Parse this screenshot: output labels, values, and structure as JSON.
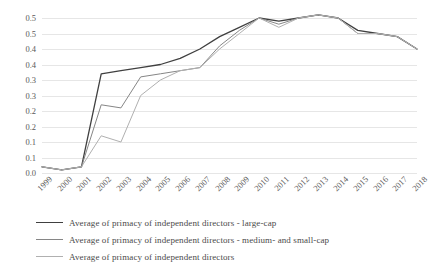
{
  "chart_data": {
    "type": "line",
    "title": "",
    "xlabel": "",
    "ylabel": "",
    "grid": true,
    "legend_position": "bottom",
    "ylim": [
      0,
      0.5
    ],
    "ytick_values": [
      0.5,
      0.45,
      0.4,
      0.35,
      0.3,
      0.25,
      0.2,
      0.15,
      0.1,
      0.05,
      0.0
    ],
    "ytick_labels": [
      "0.5",
      "0.5",
      "0.4",
      "0.4",
      "0.3",
      "0.3",
      "0.2",
      "0.2",
      "0.1",
      "0.1",
      "0.0"
    ],
    "categories": [
      "1999",
      "2000",
      "2001",
      "2002",
      "2003",
      "2004",
      "2005",
      "2006",
      "2007",
      "2008",
      "2009",
      "2010",
      "2011",
      "2012",
      "2013",
      "2014",
      "2015",
      "2016",
      "2017",
      "2018"
    ],
    "series": [
      {
        "name": "Average of primacy of independent directors - large-cap",
        "color": "#404040",
        "values": [
          0.02,
          0.01,
          0.02,
          0.32,
          0.33,
          0.34,
          0.35,
          0.37,
          0.4,
          0.44,
          0.47,
          0.5,
          0.49,
          0.5,
          0.51,
          0.5,
          0.46,
          0.45,
          0.44,
          0.4
        ]
      },
      {
        "name": "Average of primacy of independent directors - medium- and small-cap",
        "color": "#868686",
        "values": [
          0.02,
          0.01,
          0.02,
          0.22,
          0.21,
          0.31,
          0.32,
          0.33,
          0.34,
          0.41,
          0.46,
          0.5,
          0.48,
          0.5,
          0.51,
          0.5,
          0.45,
          0.45,
          0.44,
          0.4
        ]
      },
      {
        "name": "Average of primacy of independent directors",
        "color": "#b0b0b0",
        "values": [
          0.02,
          0.01,
          0.02,
          0.12,
          0.1,
          0.25,
          0.3,
          0.33,
          0.34,
          0.4,
          0.45,
          0.5,
          0.47,
          0.5,
          0.51,
          0.5,
          0.45,
          0.45,
          0.44,
          0.4
        ]
      }
    ]
  },
  "legend": {
    "items": [
      {
        "label": "Average of primacy of independent directors - large-cap",
        "color": "#404040"
      },
      {
        "label": "Average of primacy of independent directors - medium- and small-cap",
        "color": "#868686"
      },
      {
        "label": "Average of primacy of independent directors",
        "color": "#b0b0b0"
      }
    ]
  }
}
